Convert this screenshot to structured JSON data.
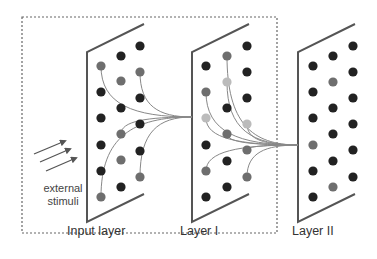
{
  "diagram": {
    "colors": {
      "panel_edge": "#555555",
      "dashed_box": "#666666",
      "dot_dark": "#222222",
      "dot_gray": "#6e6e6e",
      "dot_light": "#bbbbbb",
      "connection": "#888888",
      "arrow": "#555555"
    },
    "labels": {
      "input_layer": "Input layer",
      "layer1": "Layer I",
      "layer2": "Layer II",
      "stimuli_line1": "external",
      "stimuli_line2": "stimuli"
    },
    "dashed_box": {
      "x": 22,
      "y": 17,
      "w": 255,
      "h": 216
    },
    "panels": [
      {
        "name": "input-layer",
        "x": 87,
        "top": 52,
        "bottom": 222,
        "dx": 57,
        "dy": -28
      },
      {
        "name": "layer-1",
        "x": 192,
        "top": 52,
        "bottom": 222,
        "dx": 57,
        "dy": -28
      },
      {
        "name": "layer-2",
        "x": 298,
        "top": 52,
        "bottom": 222,
        "dx": 57,
        "dy": -28
      }
    ],
    "nodes": {
      "input_layer": [
        [
          140,
          46,
          "d"
        ],
        [
          121,
          56,
          "d"
        ],
        [
          101,
          66,
          "g"
        ],
        [
          140,
          72,
          "g"
        ],
        [
          121,
          81,
          "g"
        ],
        [
          101,
          92,
          "d"
        ],
        [
          140,
          98,
          "d"
        ],
        [
          121,
          108,
          "d"
        ],
        [
          101,
          118,
          "d"
        ],
        [
          140,
          124,
          "d"
        ],
        [
          121,
          134,
          "g"
        ],
        [
          101,
          145,
          "d"
        ],
        [
          140,
          151,
          "d"
        ],
        [
          121,
          160,
          "g"
        ],
        [
          101,
          171,
          "d"
        ],
        [
          140,
          177,
          "g"
        ],
        [
          121,
          187,
          "d"
        ],
        [
          101,
          197,
          "g"
        ]
      ],
      "layer_1": [
        [
          247,
          46,
          "d"
        ],
        [
          227,
          56,
          "g"
        ],
        [
          206,
          66,
          "d"
        ],
        [
          247,
          72,
          "d"
        ],
        [
          227,
          82,
          "l"
        ],
        [
          206,
          92,
          "g"
        ],
        [
          247,
          98,
          "d"
        ],
        [
          227,
          108,
          "d"
        ],
        [
          206,
          118,
          "l"
        ],
        [
          247,
          124,
          "l"
        ],
        [
          227,
          134,
          "g"
        ],
        [
          206,
          145,
          "d"
        ],
        [
          247,
          150,
          "g"
        ],
        [
          227,
          161,
          "d"
        ],
        [
          206,
          171,
          "g"
        ],
        [
          247,
          177,
          "g"
        ],
        [
          227,
          187,
          "d"
        ],
        [
          206,
          197,
          "d"
        ]
      ],
      "layer_2": [
        [
          353,
          46,
          "d"
        ],
        [
          333,
          56,
          "d"
        ],
        [
          313,
          66,
          "d"
        ],
        [
          353,
          72,
          "d"
        ],
        [
          333,
          82,
          "g"
        ],
        [
          313,
          92,
          "d"
        ],
        [
          353,
          98,
          "d"
        ],
        [
          333,
          108,
          "d"
        ],
        [
          313,
          118,
          "d"
        ],
        [
          353,
          124,
          "d"
        ],
        [
          333,
          134,
          "d"
        ],
        [
          313,
          145,
          "g"
        ],
        [
          353,
          150,
          "d"
        ],
        [
          333,
          161,
          "d"
        ],
        [
          313,
          171,
          "d"
        ],
        [
          353,
          177,
          "d"
        ],
        [
          333,
          187,
          "g"
        ],
        [
          313,
          197,
          "d"
        ]
      ]
    },
    "connections": {
      "input_to_layer1_target": [
        192,
        117
      ],
      "input_sources": [
        [
          101,
          66
        ],
        [
          140,
          72
        ],
        [
          121,
          134
        ],
        [
          101,
          197
        ],
        [
          140,
          177
        ]
      ],
      "layer1_to_layer2_target": [
        298,
        145
      ],
      "layer1_sources": [
        [
          227,
          56
        ],
        [
          227,
          82
        ],
        [
          206,
          92
        ],
        [
          206,
          118
        ],
        [
          247,
          124
        ],
        [
          227,
          134
        ],
        [
          247,
          150
        ],
        [
          206,
          171
        ],
        [
          247,
          177
        ]
      ]
    },
    "stimuli_arrows": [
      {
        "x1": 34,
        "y1": 154,
        "x2": 65,
        "y2": 141
      },
      {
        "x1": 40,
        "y1": 162,
        "x2": 70,
        "y2": 149
      },
      {
        "x1": 46,
        "y1": 171,
        "x2": 76,
        "y2": 158
      }
    ]
  }
}
